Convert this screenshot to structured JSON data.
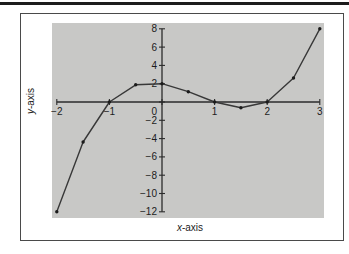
{
  "page": {
    "background": "#ffffff",
    "rule_color": "#1c1c1c"
  },
  "chart_data": {
    "type": "line",
    "title": "",
    "xlabel": "x-axis",
    "ylabel": "y-axis",
    "x": [
      -2,
      -1.5,
      -1,
      -0.5,
      0,
      0.5,
      1,
      1.5,
      2,
      2.5,
      3
    ],
    "y": [
      -12,
      -4.375,
      0,
      1.875,
      2,
      1.125,
      0,
      -0.625,
      0,
      2.625,
      8
    ],
    "x_ticks": [
      -2,
      -1,
      0,
      1,
      2,
      3
    ],
    "y_ticks": [
      8,
      6,
      4,
      2,
      0,
      -2,
      -4,
      -6,
      -8,
      -10,
      -12
    ],
    "xlim": [
      -2,
      3
    ],
    "ylim": [
      -12,
      8
    ],
    "origin_label": "0",
    "grid": false,
    "legend": "none",
    "plot_bg": "#c8c8c6",
    "axis_color": "#2b2b2b",
    "line_color": "#383838",
    "marker_color": "#1b1b1b",
    "tick_label_color": "#1c1c1c"
  }
}
